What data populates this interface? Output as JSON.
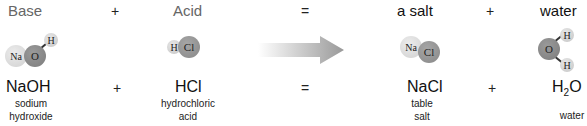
{
  "header": {
    "base": "Base",
    "plus1": "+",
    "acid": "Acid",
    "equals": "=",
    "salt": "a salt",
    "plus2": "+",
    "water": "water"
  },
  "molecules": {
    "naoh": {
      "na": "Na",
      "o": "O",
      "h": "H"
    },
    "hcl": {
      "h": "H",
      "cl": "Cl"
    },
    "nacl": {
      "na": "Na",
      "cl": "Cl"
    },
    "h2o": {
      "o": "O",
      "h1": "H",
      "h2": "H"
    }
  },
  "arrow": {
    "icon": "reaction-arrow-icon",
    "color": "#999999"
  },
  "formulas": {
    "naoh": "NaOH",
    "plus1": "+",
    "hcl": "HCl",
    "equals": "=",
    "nacl": "NaCl",
    "plus2": "+",
    "h2o_main": "H",
    "h2o_sub": "2",
    "h2o_end": "O"
  },
  "names": {
    "naoh_1": "sodium",
    "naoh_2": "hydroxide",
    "hcl_1": "hydrochloric",
    "hcl_2": "acid",
    "nacl_1": "table",
    "nacl_2": "salt",
    "h2o": "water"
  }
}
